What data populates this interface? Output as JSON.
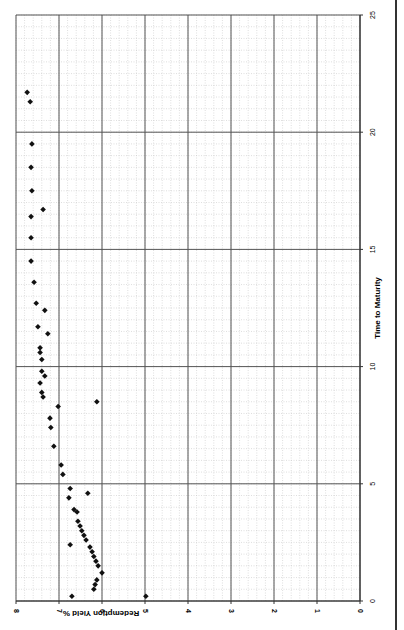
{
  "chart_data": {
    "type": "scatter",
    "orientation": "rotated-90-clockwise",
    "title": "",
    "xlabel": "Time to Maturity",
    "ylabel": "Redemption Yield %",
    "xlim": [
      0,
      25
    ],
    "ylim": [
      0,
      8
    ],
    "x_ticks": [
      0,
      5,
      10,
      15,
      20,
      25
    ],
    "y_ticks": [
      0,
      1,
      2,
      3,
      4,
      5,
      6,
      7,
      8
    ],
    "grid": {
      "major": true,
      "minor": true
    },
    "legend": null,
    "marker": "diamond",
    "marker_color": "#111111",
    "points": [
      {
        "x": 0.2,
        "y": 4.98
      },
      {
        "x": 0.2,
        "y": 6.7
      },
      {
        "x": 0.5,
        "y": 6.19
      },
      {
        "x": 0.7,
        "y": 6.16
      },
      {
        "x": 0.9,
        "y": 6.12
      },
      {
        "x": 1.2,
        "y": 6.0
      },
      {
        "x": 1.5,
        "y": 6.09
      },
      {
        "x": 1.7,
        "y": 6.14
      },
      {
        "x": 1.9,
        "y": 6.19
      },
      {
        "x": 2.1,
        "y": 6.23
      },
      {
        "x": 2.3,
        "y": 6.28
      },
      {
        "x": 2.4,
        "y": 6.74
      },
      {
        "x": 2.6,
        "y": 6.37
      },
      {
        "x": 2.8,
        "y": 6.42
      },
      {
        "x": 3.0,
        "y": 6.47
      },
      {
        "x": 3.2,
        "y": 6.51
      },
      {
        "x": 3.4,
        "y": 6.56
      },
      {
        "x": 3.8,
        "y": 6.58
      },
      {
        "x": 3.9,
        "y": 6.65
      },
      {
        "x": 4.4,
        "y": 6.77
      },
      {
        "x": 4.6,
        "y": 6.33
      },
      {
        "x": 4.8,
        "y": 6.74
      },
      {
        "x": 5.4,
        "y": 6.91
      },
      {
        "x": 5.8,
        "y": 6.95
      },
      {
        "x": 6.6,
        "y": 7.12
      },
      {
        "x": 7.4,
        "y": 7.19
      },
      {
        "x": 7.8,
        "y": 7.21
      },
      {
        "x": 8.3,
        "y": 7.02
      },
      {
        "x": 8.5,
        "y": 6.12
      },
      {
        "x": 8.7,
        "y": 7.37
      },
      {
        "x": 8.9,
        "y": 7.4
      },
      {
        "x": 9.3,
        "y": 7.44
      },
      {
        "x": 9.6,
        "y": 7.33
      },
      {
        "x": 9.8,
        "y": 7.4
      },
      {
        "x": 10.3,
        "y": 7.4
      },
      {
        "x": 10.6,
        "y": 7.44
      },
      {
        "x": 10.8,
        "y": 7.44
      },
      {
        "x": 11.4,
        "y": 7.26
      },
      {
        "x": 11.7,
        "y": 7.49
      },
      {
        "x": 12.4,
        "y": 7.33
      },
      {
        "x": 12.7,
        "y": 7.53
      },
      {
        "x": 13.6,
        "y": 7.58
      },
      {
        "x": 14.5,
        "y": 7.65
      },
      {
        "x": 15.5,
        "y": 7.65
      },
      {
        "x": 16.4,
        "y": 7.65
      },
      {
        "x": 16.7,
        "y": 7.37
      },
      {
        "x": 17.5,
        "y": 7.63
      },
      {
        "x": 18.5,
        "y": 7.65
      },
      {
        "x": 19.5,
        "y": 7.63
      },
      {
        "x": 21.3,
        "y": 7.67
      },
      {
        "x": 21.7,
        "y": 7.74
      }
    ]
  },
  "labels": {
    "xlabel": "Time to Maturity",
    "ylabel": "Redemption Yield %",
    "x_tick_labels": [
      "0",
      "5",
      "10",
      "15",
      "20",
      "25"
    ],
    "y_tick_labels": [
      "0",
      "1",
      "2",
      "3",
      "4",
      "5",
      "6",
      "7",
      "8"
    ]
  },
  "colors": {
    "major_grid": "#555555",
    "minor_grid": "#c8c8c8",
    "axis": "#333333",
    "marker": "#111111",
    "background": "#ffffff"
  }
}
